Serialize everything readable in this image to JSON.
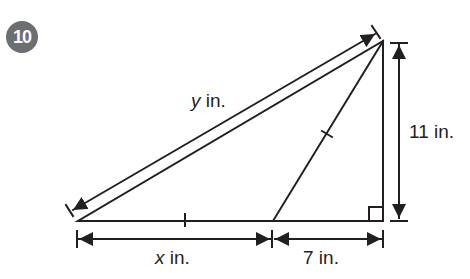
{
  "problem": {
    "number": "10"
  },
  "diagram": {
    "labels": {
      "hypotenuse_var": "y",
      "hypotenuse_unit": " in.",
      "height": "11 in.",
      "base_left_var": "x",
      "base_left_unit": " in.",
      "base_right": "7 in."
    },
    "colors": {
      "stroke": "#231f20",
      "badge": "#6d6e71"
    }
  }
}
